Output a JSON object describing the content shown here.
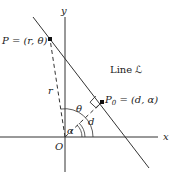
{
  "diagram": {
    "axes": {
      "x_label": "x",
      "y_label": "y",
      "origin_label": "O"
    },
    "points": {
      "P": {
        "label": "P = (r, θ)"
      },
      "P0": {
        "label_main": "P",
        "label_sub": "0",
        "label_rest": " = (d, α)"
      }
    },
    "line_label": "Line ℒ",
    "segment_labels": {
      "r": "r",
      "d": "d"
    },
    "angle_labels": {
      "theta": "θ",
      "alpha": "α"
    },
    "colors": {
      "stroke": "#333333",
      "text": "#222222",
      "background": "#ffffff"
    }
  }
}
